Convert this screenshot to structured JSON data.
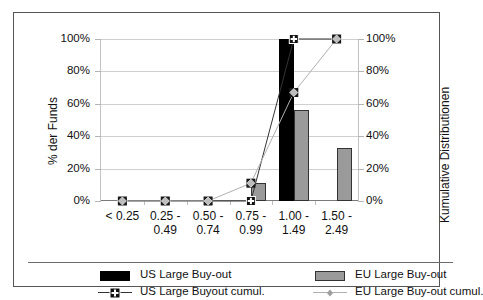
{
  "chart_data": {
    "type": "bar",
    "title": "",
    "xlabel": "",
    "ylabel": "% der Funds",
    "y2label": "Kumulative Distributionen",
    "ylim": [
      0,
      100
    ],
    "y2lim": [
      0,
      100
    ],
    "grid": true,
    "legend_position": "bottom",
    "categories": [
      "< 0.25",
      "0.25 - 0.49",
      "0.50 - 0.74",
      "0.75 - 0.99",
      "1.00 - 1.49",
      "1.50 - 2.49"
    ],
    "category_lines": [
      [
        "< 0.25",
        ""
      ],
      [
        "0.25 -",
        "0.49"
      ],
      [
        "0.50 -",
        "0.74"
      ],
      [
        "0.75 -",
        "0.99"
      ],
      [
        "1.00 -",
        "1.49"
      ],
      [
        "1.50 -",
        "2.49"
      ]
    ],
    "ytick_labels": [
      "0%",
      "20%",
      "40%",
      "60%",
      "80%",
      "100%"
    ],
    "ytick_values": [
      0,
      20,
      40,
      60,
      80,
      100
    ],
    "y2tick_labels": [
      "0%",
      "20%",
      "40%",
      "60%",
      "80%",
      "100%"
    ],
    "y2tick_values": [
      0,
      20,
      40,
      60,
      80,
      100
    ],
    "series": [
      {
        "name": "US Large Buy-out",
        "kind": "bar",
        "axis": "left",
        "color": "#000000",
        "values": [
          0,
          0,
          0,
          0,
          100,
          0
        ]
      },
      {
        "name": "EU Large Buy-out",
        "kind": "bar",
        "axis": "left",
        "color": "#9a9a9a",
        "values": [
          0,
          0,
          0,
          11,
          56,
          33
        ]
      },
      {
        "name": "US Large Buyout cumul.",
        "kind": "line",
        "axis": "right",
        "color": "#333333",
        "marker": "plus-square",
        "values": [
          0,
          0,
          0,
          0,
          100,
          100
        ]
      },
      {
        "name": "EU Large Buy-out cumul.",
        "kind": "line",
        "axis": "right",
        "color": "#b0b0b0",
        "marker": "diamond",
        "values": [
          0,
          0,
          0,
          11,
          67,
          100
        ]
      }
    ]
  },
  "axes": {
    "left_title": "% der Funds",
    "right_title": "Kumulative Distributionen"
  },
  "legend": {
    "items": [
      {
        "label": "US Large Buy-out",
        "key": "swatch-black"
      },
      {
        "label": "EU Large Buy-out",
        "key": "swatch-gray"
      },
      {
        "label": "US Large Buyout cumul.",
        "key": "line-plus-square"
      },
      {
        "label": "EU Large Buy-out cumul.",
        "key": "line-diamond"
      }
    ]
  },
  "colors": {
    "us_bar": "#000000",
    "eu_bar": "#9a9a9a",
    "us_line": "#333333",
    "eu_line": "#b0b0b0",
    "grid": "#cfcfcf",
    "frame": "#555555"
  }
}
